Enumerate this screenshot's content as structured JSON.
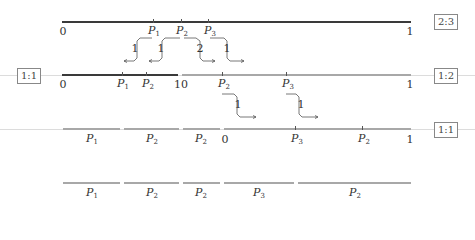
{
  "ratios": {
    "top": "2:3",
    "middle_left": "1:1",
    "middle_right": "1:2",
    "bottom": "1:1"
  },
  "axis_labels": {
    "zero": "0",
    "one": "1",
    "ten": "10"
  },
  "points": {
    "p1": "P",
    "p1_sub": "1",
    "p2": "P",
    "p2_sub": "2",
    "p3": "P",
    "p3_sub": "3"
  },
  "weights": {
    "w1": "1",
    "w2": "1",
    "w3": "2",
    "w4": "1",
    "w5": "1",
    "w6": "1"
  },
  "rows": {
    "row1": {
      "ratio": "2:3",
      "points": [
        "P1",
        "P2",
        "P3"
      ],
      "ends": [
        "0",
        "1"
      ]
    },
    "row2": {
      "ratio_left": "1:1",
      "ratio_right": "1:2",
      "left_points": [
        "P1",
        "P2"
      ],
      "right_points": [
        "P2",
        "P3"
      ],
      "ends": [
        "0",
        "1",
        "0",
        "1"
      ]
    },
    "row3": {
      "ratio": "1:1",
      "segments": [
        "P1",
        "P2",
        "P2"
      ],
      "right_points": [
        "P3",
        "P2"
      ],
      "ends": [
        "0",
        "1"
      ]
    },
    "row4": {
      "segments": [
        "P1",
        "P2",
        "P2",
        "P3",
        "P2"
      ]
    }
  }
}
